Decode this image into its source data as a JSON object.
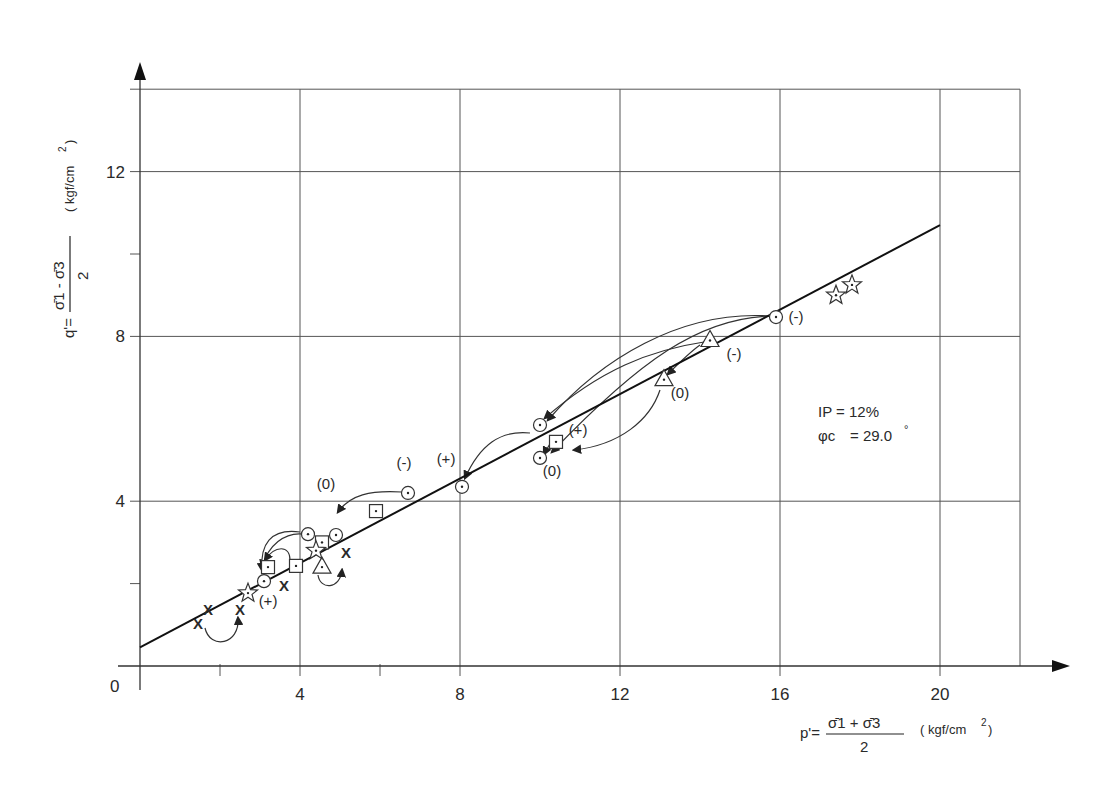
{
  "chart_data": {
    "type": "scatter",
    "title": "",
    "xlabel": "p' = (σ̄1 + σ̄3) / 2  (kgf/cm²)",
    "ylabel": "q' = (σ̄1 − σ̄3) / 2  (kgf/cm²)",
    "xlim": [
      0,
      22
    ],
    "ylim": [
      0,
      14
    ],
    "x_ticks": [
      0,
      4,
      8,
      12,
      16,
      20
    ],
    "y_ticks": [
      0,
      4,
      8,
      12
    ],
    "x_minor_ticks": [
      2,
      6
    ],
    "y_minor_ticks": [
      2,
      10
    ],
    "grid": true,
    "legend": null,
    "annotations": {
      "ip": "IP = 12%",
      "phi_symbol": "φc",
      "phi_value": "= 29.0",
      "degree": "°"
    },
    "fit_line": {
      "name": "Critical state line",
      "x": [
        0,
        20
      ],
      "y": [
        0.45,
        10.7
      ]
    },
    "series": [
      {
        "name": "circle",
        "marker": "circle-dot",
        "x": [
          15.9,
          10.0,
          10.0,
          8.05,
          6.7,
          4.2,
          4.9,
          3.1
        ],
        "y": [
          8.47,
          5.85,
          5.05,
          4.35,
          4.2,
          3.2,
          3.18,
          2.06
        ]
      },
      {
        "name": "square",
        "marker": "square-dot",
        "x": [
          10.4,
          5.9,
          4.55,
          3.9,
          3.2
        ],
        "y": [
          5.44,
          3.76,
          3.0,
          2.43,
          2.4
        ]
      },
      {
        "name": "triangle",
        "marker": "triangle-dot",
        "x": [
          14.25,
          13.1,
          4.55
        ],
        "y": [
          7.9,
          6.95,
          2.4
        ]
      },
      {
        "name": "star",
        "marker": "star-dot",
        "x": [
          17.8,
          17.4,
          4.4,
          2.7
        ],
        "y": [
          9.25,
          9.0,
          2.8,
          1.77
        ]
      },
      {
        "name": "cross",
        "marker": "x",
        "x": [
          5.15,
          3.6,
          2.5,
          1.7,
          1.45
        ],
        "y": [
          2.74,
          1.94,
          1.36,
          1.36,
          1.02
        ]
      }
    ],
    "path_labels": [
      {
        "text": "(-)",
        "x": 16.4,
        "y": 8.35
      },
      {
        "text": "(-)",
        "x": 14.85,
        "y": 7.45
      },
      {
        "text": "(-)",
        "x": 6.6,
        "y": 4.8
      },
      {
        "text": "(0)",
        "x": 13.5,
        "y": 6.5
      },
      {
        "text": "(0)",
        "x": 10.3,
        "y": 4.6
      },
      {
        "text": "(0)",
        "x": 4.65,
        "y": 4.3
      },
      {
        "text": "(+)",
        "x": 10.95,
        "y": 5.6
      },
      {
        "text": "(+)",
        "x": 7.65,
        "y": 4.9
      },
      {
        "text": "(+)",
        "x": 3.2,
        "y": 1.45
      }
    ]
  },
  "axes": {
    "y_label_parts": {
      "q": "q'=",
      "num": "σ̄1 - σ̄3",
      "den": "2",
      "unit": "( kgf/cm",
      "sup": "2",
      "close": ")"
    },
    "x_label_parts": {
      "p": "p'=",
      "num": "σ̄1 + σ̄3",
      "den": "2",
      "unit": "( kgf/cm",
      "sup": "2",
      "close": " )"
    }
  }
}
